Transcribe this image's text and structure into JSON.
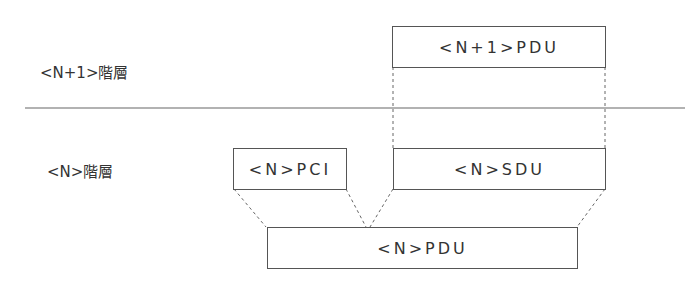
{
  "layers": {
    "upper": "<N+1>階層",
    "lower": "<N>階層"
  },
  "boxes": {
    "n1_pdu": "<N+1>PDU",
    "n_pci": "<N>PCI",
    "n_sdu": "<N>SDU",
    "n_pdu": "<N>PDU"
  },
  "colors": {
    "line": "#555555",
    "text": "#333333"
  }
}
